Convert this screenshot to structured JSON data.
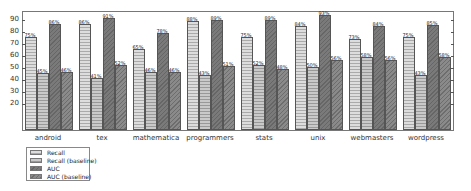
{
  "chart_data": {
    "type": "bar",
    "title": "",
    "xlabel": "",
    "ylabel": "",
    "ylim": [
      0,
      100
    ],
    "yticks": [
      20,
      30,
      40,
      50,
      60,
      70,
      80,
      90
    ],
    "categories": [
      "android",
      "tex",
      "mathematica",
      "programmers",
      "stats",
      "unix",
      "webmasters",
      "wordpress"
    ],
    "series": [
      {
        "name": "Recall",
        "values": [
          75,
          86,
          65,
          88,
          75,
          84,
          73,
          75
        ]
      },
      {
        "name": "Recall (baseline)",
        "values": [
          45,
          41,
          46,
          43,
          52,
          50,
          58,
          43
        ]
      },
      {
        "name": "AUC",
        "values": [
          86,
          91,
          78,
          89,
          89,
          93,
          84,
          85
        ]
      },
      {
        "name": "AUC (baseline)",
        "values": [
          46,
          52,
          46,
          51,
          48,
          56,
          56,
          58
        ]
      }
    ],
    "value_label_suffix": "%",
    "grid": false,
    "legend_position": "below-left"
  },
  "legend": {
    "items": [
      "Recall",
      "Recall (baseline)",
      "AUC",
      "AUC (baseline)"
    ]
  }
}
